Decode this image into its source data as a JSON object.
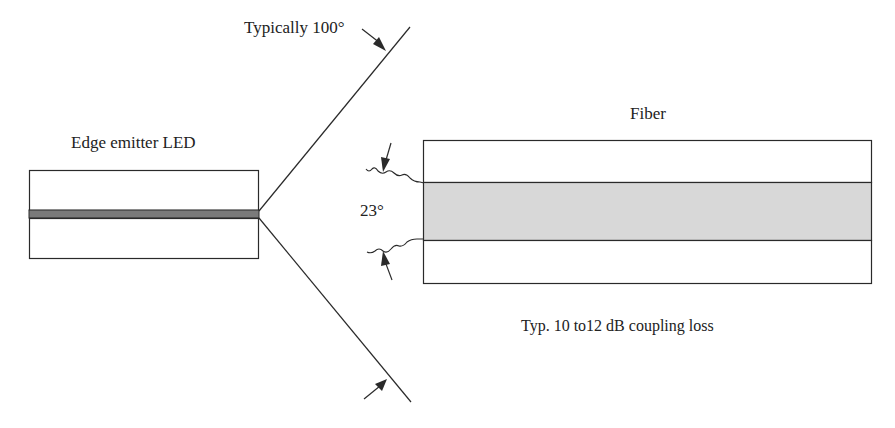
{
  "labels": {
    "beam_angle": "Typically 100°",
    "led": "Edge emitter LED",
    "fiber": "Fiber",
    "acceptance_angle": "23°",
    "coupling_loss": "Typ. 10 to12 dB coupling loss"
  },
  "colors": {
    "line": "#2a2a2a",
    "active_stripe": "#7a7a7a",
    "fiber_core": "#d8d8d8",
    "background": "#ffffff"
  }
}
